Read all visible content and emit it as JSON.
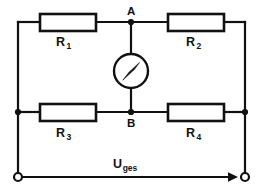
{
  "diagram": {
    "type": "electrical-schematic",
    "canvas": {
      "width": 262,
      "height": 194
    },
    "colors": {
      "background": "#ffffff",
      "wire": "#111111",
      "text": "#111111",
      "component_fill": "#ffffff"
    }
  },
  "labels": {
    "r1": "R",
    "r1_sub": "1",
    "r2": "R",
    "r2_sub": "2",
    "r3": "R",
    "r3_sub": "3",
    "r4": "R",
    "r4_sub": "4",
    "node_a": "A",
    "node_b": "B",
    "voltage": "U",
    "voltage_sub": "ges"
  },
  "components": [
    {
      "name": "resistor-r1",
      "label": "R1",
      "kind": "resistor",
      "x": 40,
      "y": 14,
      "w": 56,
      "h": 17
    },
    {
      "name": "resistor-r2",
      "label": "R2",
      "kind": "resistor",
      "x": 168,
      "y": 14,
      "w": 56,
      "h": 17
    },
    {
      "name": "resistor-r3",
      "label": "R3",
      "kind": "resistor",
      "x": 40,
      "y": 104,
      "w": 56,
      "h": 17
    },
    {
      "name": "resistor-r4",
      "label": "R4",
      "kind": "resistor",
      "x": 168,
      "y": 104,
      "w": 56,
      "h": 17
    },
    {
      "name": "galvanometer",
      "label": "meter",
      "kind": "meter",
      "cx": 131,
      "cy": 71,
      "r": 17
    }
  ],
  "nodes": [
    {
      "name": "node-a",
      "label": "A",
      "x": 131,
      "y": 22
    },
    {
      "name": "node-b",
      "label": "B",
      "x": 131,
      "y": 112
    },
    {
      "name": "junction-left",
      "label": "",
      "x": 18,
      "y": 112
    },
    {
      "name": "junction-right",
      "label": "",
      "x": 245,
      "y": 112
    }
  ],
  "terminals": [
    {
      "name": "terminal-left",
      "x": 18,
      "y": 177,
      "r": 4
    },
    {
      "name": "terminal-right",
      "x": 245,
      "y": 177,
      "r": 4
    }
  ],
  "annotations": {
    "supply_arrow": {
      "name": "voltage-arrow",
      "label": "Uges",
      "from_x": 22,
      "to_x": 238,
      "y": 177,
      "direction": "right"
    }
  }
}
